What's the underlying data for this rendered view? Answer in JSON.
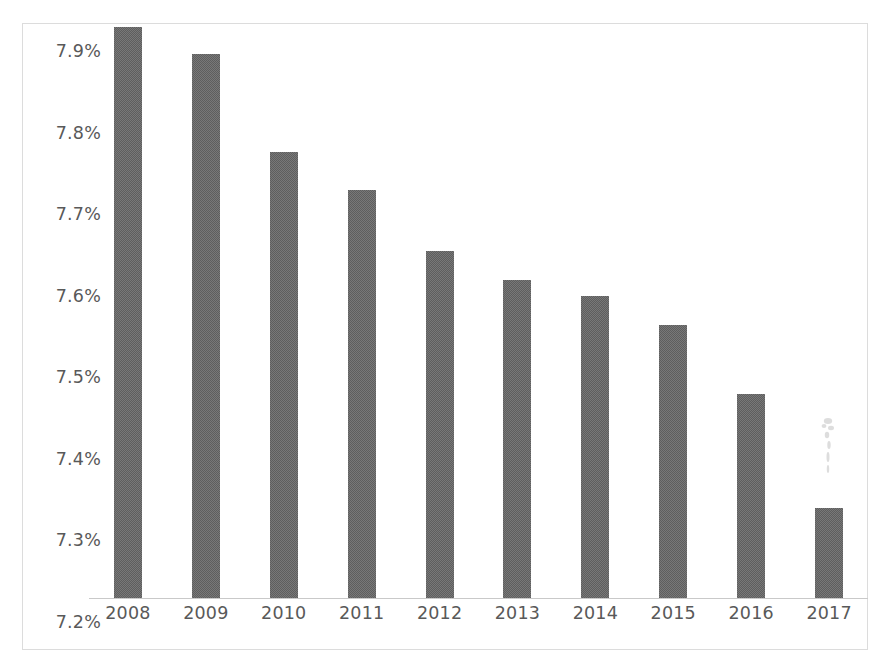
{
  "chart_data": {
    "type": "bar",
    "title": "",
    "subtitle": "",
    "xlabel": "",
    "ylabel": "",
    "categories": [
      "2008",
      "2009",
      "2010",
      "2011",
      "2012",
      "2013",
      "2014",
      "2015",
      "2016",
      "2017"
    ],
    "values": [
      7.9,
      7.867,
      7.747,
      7.7,
      7.625,
      7.59,
      7.57,
      7.535,
      7.45,
      7.31
    ],
    "value_labels": [
      "7.90%",
      "7.87%",
      "7.75%",
      "7.70%",
      "7.63%",
      "7.59%",
      "7.57%",
      "7.54%",
      "7.45%",
      "7.31%"
    ],
    "ylim": [
      7.2,
      7.9
    ],
    "ytick_values": [
      7.9,
      7.8,
      7.7,
      7.6,
      7.5,
      7.4,
      7.3,
      7.2
    ],
    "ytick_labels": [
      "7.9%",
      "7.8%",
      "7.7%",
      "7.6%",
      "7.5%",
      "7.4%",
      "7.3%",
      "7.2%"
    ],
    "grid": false,
    "legend": false,
    "legend_position": "none",
    "series": [
      {
        "name": "",
        "values": [
          7.9,
          7.867,
          7.747,
          7.7,
          7.625,
          7.59,
          7.57,
          7.535,
          7.45,
          7.31
        ],
        "color": "#5e5e5e"
      }
    ],
    "annotations": []
  },
  "colors": {
    "bar_fill": "#5e5e5e",
    "axis_text": "#595959",
    "axis_line": "#c9c9c9",
    "frame_border": "#dcdcdc",
    "background": "#ffffff"
  }
}
